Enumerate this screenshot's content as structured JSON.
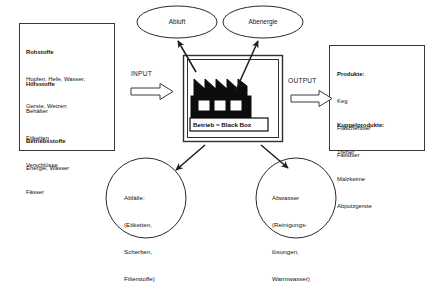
{
  "diagram": {
    "colors": {
      "stroke": "#2b2b2b",
      "factory_stroke": "#000000",
      "text": "#141414",
      "background": "#ffffff"
    },
    "input_box": {
      "sections": [
        {
          "heading": "Rohstoffe",
          "lines": [
            "Hopfen, Hefe, Wasser,",
            "Gerste, Weizen"
          ]
        },
        {
          "heading": "Hilfsstoffe",
          "lines": [
            "Behälter",
            "Etiketten",
            "Verschlüsse",
            "Fässer"
          ]
        },
        {
          "heading": "Betriebsstoffe",
          "lines": [
            "Energie, Wasser"
          ]
        }
      ]
    },
    "output_box": {
      "sections": [
        {
          "heading": "Produkte:",
          "lines": [
            "Keg",
            "Flaschenbier",
            "Fassbier"
          ]
        },
        {
          "heading": "Kuppelprodukte:",
          "lines": [
            "Treber",
            "Malzkeime",
            "Abputzgerste"
          ]
        }
      ]
    },
    "input_label": "INPUT",
    "output_label": "OUTPUT",
    "factory_caption": "Betrieb = Black Box",
    "ellipses": [
      {
        "id": "abluft",
        "label": "Abluft"
      },
      {
        "id": "abenergie",
        "label": "Abenergie"
      }
    ],
    "circles": [
      {
        "id": "abfaelle",
        "lines": [
          "Abfälle:",
          "(Etiketten,",
          "Scherben,",
          "Filterstoffe)"
        ]
      },
      {
        "id": "abwasser",
        "lines": [
          "Abwasser",
          "(Reinigungs-",
          "lösungen,",
          "Warmwasser)"
        ]
      }
    ]
  }
}
